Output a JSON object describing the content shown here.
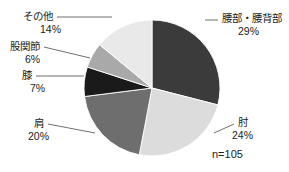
{
  "chart_data": {
    "type": "pie",
    "title": "",
    "subtitle": "",
    "xlabel": "",
    "ylabel": "",
    "legend_position": "none",
    "grid": false,
    "total_label": "n=105",
    "total": 105,
    "start_angle_deg": 0,
    "direction": "clockwise",
    "categories": [
      "腰部・腰背部",
      "肘",
      "肩",
      "膝",
      "股関節",
      "その他"
    ],
    "values": [
      29,
      24,
      20,
      7,
      6,
      14
    ],
    "value_unit": "%",
    "slices": [
      {
        "label": "腰部・腰背部",
        "value": 29,
        "value_text": "29%",
        "color": "#3b3b3b",
        "label_x": 222,
        "label_y": 22,
        "pct_x": 238,
        "pct_y": 35,
        "anchor": "start",
        "leader": "M 205,20 L 218,20"
      },
      {
        "label": "肘",
        "value": 24,
        "value_text": "24%",
        "color": "#dcdcdc",
        "label_x": 238,
        "label_y": 126,
        "pct_x": 232,
        "pct_y": 139,
        "anchor": "start",
        "leader": "M 214,133 L 234,124"
      },
      {
        "label": "肩",
        "value": 20,
        "value_text": "20%",
        "color": "#6e6e6e",
        "label_x": 44,
        "label_y": 127,
        "pct_x": 28,
        "pct_y": 140,
        "anchor": "end",
        "leader": "M 48,124 L 95,133"
      },
      {
        "label": "膝",
        "value": 7,
        "value_text": "7%",
        "color": "#1a1a1a",
        "label_x": 32,
        "label_y": 79,
        "pct_x": 30,
        "pct_y": 92,
        "anchor": "end",
        "leader": "M 36,76 L 84,76"
      },
      {
        "label": "股関節",
        "value": 6,
        "value_text": "6%",
        "color": "#a9a9a9",
        "label_x": 40,
        "label_y": 50,
        "pct_x": 25,
        "pct_y": 63,
        "anchor": "end",
        "leader": "M 44,47 L 90,58"
      },
      {
        "label": "その他",
        "value": 14,
        "value_text": "14%",
        "color": "#e9e9e9",
        "label_x": 53,
        "label_y": 20,
        "pct_x": 40,
        "pct_y": 33,
        "anchor": "end",
        "leader": "M 57,17 L 112,17"
      }
    ],
    "geometry": {
      "cx": 152,
      "cy": 88,
      "r": 68
    },
    "n_label": {
      "text": "n=105",
      "x": 212,
      "y": 158
    }
  }
}
